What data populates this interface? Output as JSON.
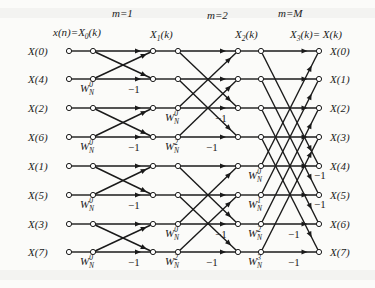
{
  "stage_labels": [
    {
      "text": "m=1",
      "x": 112,
      "y": 17
    },
    {
      "text": "m=2",
      "x": 207,
      "y": 19
    },
    {
      "text": "m=M",
      "x": 278,
      "y": 17
    }
  ],
  "column_labels": [
    {
      "text": "x(n)=X",
      "sub": "0",
      "tail": "(k)",
      "x": 53,
      "y": 36
    },
    {
      "text": "X",
      "sub": "1",
      "tail": "(k)",
      "x": 150,
      "y": 38
    },
    {
      "text": "X",
      "sub": "2",
      "tail": "(k)",
      "x": 235,
      "y": 38
    },
    {
      "text": "X",
      "sub": "3",
      "tail": "(k)= X(k)",
      "x": 290,
      "y": 38
    }
  ],
  "inputs": [
    "X(0)",
    "X(4)",
    "X(2)",
    "X(6)",
    "X(1)",
    "X(5)",
    "X(3)",
    "X(7)"
  ],
  "outputs": [
    "X(0)",
    "X(1)",
    "X(2)",
    "X(3)",
    "X(4)",
    "X(5)",
    "X(6)",
    "X(7)"
  ],
  "rows_y": [
    51,
    79,
    108,
    137,
    166,
    195,
    224,
    252
  ],
  "columns_x": {
    "in": 69,
    "s1a": 93,
    "s1b": 153,
    "s2a": 178,
    "s2b": 238,
    "s3a": 261,
    "out": 319
  },
  "stage1_twiddles": [
    {
      "row": 1,
      "text": "W",
      "sub": "N",
      "sup": "0"
    },
    {
      "row": 3,
      "text": "W",
      "sub": "N",
      "sup": "0"
    },
    {
      "row": 5,
      "text": "W",
      "sub": "N",
      "sup": "0"
    },
    {
      "row": 7,
      "text": "W",
      "sub": "N",
      "sup": "0"
    }
  ],
  "stage2_twiddles": [
    {
      "row": 2,
      "text": "W",
      "sub": "N",
      "sup": "0"
    },
    {
      "row": 3,
      "text": "W",
      "sub": "N",
      "sup": "2"
    },
    {
      "row": 6,
      "text": "W",
      "sub": "N",
      "sup": "0"
    },
    {
      "row": 7,
      "text": "W",
      "sub": "N",
      "sup": "2"
    }
  ],
  "stage3_twiddles": [
    {
      "row": 4,
      "text": "W",
      "sub": "N",
      "sup": "0"
    },
    {
      "row": 5,
      "text": "W",
      "sub": "N",
      "sup": "1"
    },
    {
      "row": 6,
      "text": "W",
      "sub": "N",
      "sup": "2"
    },
    {
      "row": 7,
      "text": "W",
      "sub": "N",
      "sup": "3"
    }
  ],
  "minus_one_label": "−1",
  "stage1_minus_rows": [
    1,
    3,
    5,
    7
  ],
  "stage2_minus_rows": [
    2,
    3,
    6,
    7
  ],
  "stage3_minus_rows": [
    4,
    5,
    6,
    7
  ],
  "colors": {
    "ink": "#1a1a1a",
    "background": "#fbfbf9",
    "node_fill": "#ffffff"
  }
}
